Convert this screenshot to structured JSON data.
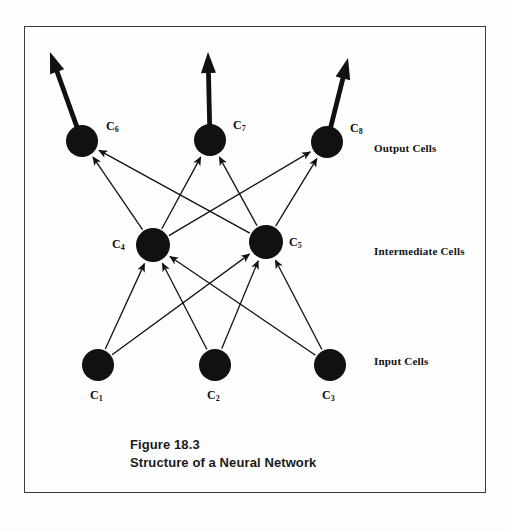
{
  "figure": {
    "caption_line1": "Figure 18.3",
    "caption_line2": "Structure of a Neural Network",
    "border_color": "#3a3a3a",
    "background_color": "#fefefe",
    "node_color": "#111111",
    "edge_color": "#111111"
  },
  "layer_labels": {
    "output": "Output Cells",
    "intermediate": "Intermediate Cells",
    "input": "Input Cells"
  },
  "nodes": [
    {
      "id": "C1",
      "letter": "C",
      "index": "1",
      "layer": "input",
      "cx": 98,
      "cy": 365,
      "r": 16,
      "label_x": 90,
      "label_y": 389
    },
    {
      "id": "C2",
      "letter": "C",
      "index": "2",
      "layer": "input",
      "cx": 215,
      "cy": 365,
      "r": 16,
      "label_x": 207,
      "label_y": 389
    },
    {
      "id": "C3",
      "letter": "C",
      "index": "3",
      "layer": "input",
      "cx": 330,
      "cy": 365,
      "r": 16,
      "label_x": 322,
      "label_y": 389
    },
    {
      "id": "C4",
      "letter": "C",
      "index": "4",
      "layer": "intermediate",
      "cx": 153,
      "cy": 245,
      "r": 17,
      "label_x": 112,
      "label_y": 238
    },
    {
      "id": "C5",
      "letter": "C",
      "index": "5",
      "layer": "intermediate",
      "cx": 266,
      "cy": 242,
      "r": 17,
      "label_x": 289,
      "label_y": 236
    },
    {
      "id": "C6",
      "letter": "C",
      "index": "6",
      "layer": "output",
      "cx": 82,
      "cy": 141,
      "r": 16,
      "label_x": 106,
      "label_y": 120
    },
    {
      "id": "C7",
      "letter": "C",
      "index": "7",
      "layer": "output",
      "cx": 210,
      "cy": 140,
      "r": 16,
      "label_x": 233,
      "label_y": 119
    },
    {
      "id": "C8",
      "letter": "C",
      "index": "8",
      "layer": "output",
      "cx": 327,
      "cy": 142,
      "r": 16,
      "label_x": 350,
      "label_y": 122
    }
  ],
  "edges": [
    {
      "from": "C1",
      "to": "C4"
    },
    {
      "from": "C1",
      "to": "C5"
    },
    {
      "from": "C2",
      "to": "C4"
    },
    {
      "from": "C2",
      "to": "C5"
    },
    {
      "from": "C3",
      "to": "C4"
    },
    {
      "from": "C3",
      "to": "C5"
    },
    {
      "from": "C4",
      "to": "C6"
    },
    {
      "from": "C4",
      "to": "C7"
    },
    {
      "from": "C4",
      "to": "C8"
    },
    {
      "from": "C5",
      "to": "C6"
    },
    {
      "from": "C5",
      "to": "C7"
    },
    {
      "from": "C5",
      "to": "C8"
    }
  ],
  "output_arrows": [
    {
      "from": "C6",
      "tip_x": 50,
      "tip_y": 52
    },
    {
      "from": "C7",
      "tip_x": 208,
      "tip_y": 52
    },
    {
      "from": "C8",
      "tip_x": 348,
      "tip_y": 58
    }
  ]
}
